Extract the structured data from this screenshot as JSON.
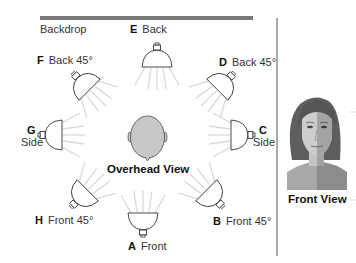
{
  "backdrop": {
    "label": "Backdrop"
  },
  "lights": [
    {
      "letter": "E",
      "name": "Back"
    },
    {
      "letter": "F",
      "name": "Back 45°"
    },
    {
      "letter": "D",
      "name": "Back 45°"
    },
    {
      "letter": "G",
      "name": "Side"
    },
    {
      "letter": "C",
      "name": "Side"
    },
    {
      "letter": "H",
      "name": "Front 45°"
    },
    {
      "letter": "B",
      "name": "Front 45°"
    },
    {
      "letter": "A",
      "name": "Front"
    }
  ],
  "views": {
    "overhead": "Overhead View",
    "front": "Front View"
  },
  "icons": {
    "lamp": "spotlight-icon",
    "head": "overhead-head-icon",
    "face": "front-face-portrait"
  },
  "colors": {
    "backdrop_bar": "#7a7a7a",
    "divider": "#555555",
    "lamp_stroke": "#333333",
    "ray": "#d6d6d6",
    "head_fill": "#c8c8c8",
    "hair": "#5a5a5a",
    "skin_light": "#cfcfcf",
    "skin_shadow": "#9a9a9a"
  }
}
